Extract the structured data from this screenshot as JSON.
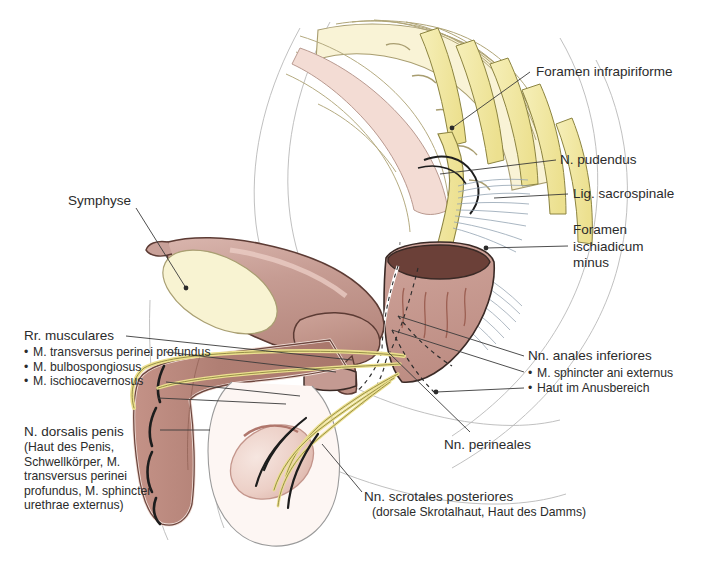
{
  "figure": {
    "colors": {
      "nerve_yellow": "#f2e9a8",
      "nerve_outline": "#8c8440",
      "organ_rose": "#c49a92",
      "organ_rose_dark": "#a9766c",
      "rectum_lumen": "#6b4038",
      "bone_cream": "#f7f0cd",
      "bone_outline": "#a49a6e",
      "skin_pale": "#f4ded8",
      "symphysis_cream": "#f7f2cf",
      "ligament_blue": "#9aa7b4",
      "leader_line": "#3a3a3a",
      "text": "#2b2b2b",
      "background": "#ffffff"
    }
  },
  "labels": {
    "foramen_infrapiriforme": "Foramen infrapiriforme",
    "n_pudendus": "N. pudendus",
    "lig_sacrospinale": "Lig. sacrospinale",
    "foramen_ischiadicum_minus": "Foramen\nischiadicum\nminus",
    "symphyse": "Symphyse",
    "rr_musculares": "Rr. musculares",
    "rr_musculares_items": [
      "M. transversus perinei profundus",
      "M. bulbospongiosus",
      "M. ischiocavernosus"
    ],
    "n_dorsalis_penis": "N. dorsalis penis",
    "n_dorsalis_penis_note": "(Haut des Penis, Schwellkörper, M. transversus perinei profundus, M. sphincter urethrae externus)",
    "nn_anales_inferiores": "Nn. anales inferiores",
    "nn_anales_inferiores_items": [
      "M. sphincter ani externus",
      "Haut im Anusbereich"
    ],
    "nn_perineales": "Nn. perineales",
    "nn_scrotales_posteriores": "Nn. scrotales posteriores",
    "nn_scrotales_posteriores_note": "(dorsale Skrotalhaut, Haut des Damms)"
  },
  "structures": [
    {
      "name": "sacrum",
      "kind": "bone"
    },
    {
      "name": "sacral-nerve-roots",
      "kind": "nerve"
    },
    {
      "name": "piriformis-muscle",
      "kind": "muscle"
    },
    {
      "name": "lig-sacrospinale",
      "kind": "ligament"
    },
    {
      "name": "lig-sacrotuberale",
      "kind": "ligament"
    },
    {
      "name": "urinary-bladder",
      "kind": "organ"
    },
    {
      "name": "symphysis-pubis",
      "kind": "bone"
    },
    {
      "name": "prostate",
      "kind": "organ"
    },
    {
      "name": "rectum",
      "kind": "organ"
    },
    {
      "name": "penis-shaft",
      "kind": "organ"
    },
    {
      "name": "testis",
      "kind": "organ"
    },
    {
      "name": "scrotum",
      "kind": "organ"
    },
    {
      "name": "pudendal-nerve",
      "kind": "nerve"
    }
  ]
}
